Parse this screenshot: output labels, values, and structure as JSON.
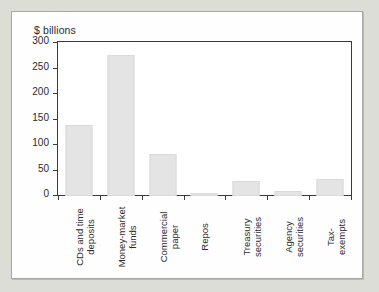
{
  "chart_data": {
    "type": "bar",
    "title": "",
    "subtitle": "",
    "ylabel": "$ billions",
    "xlabel": "",
    "ylim": [
      0,
      300
    ],
    "yticks": [
      0,
      50,
      100,
      150,
      200,
      250,
      300
    ],
    "ytick_labels": [
      "0",
      "50",
      "100",
      "150",
      "200",
      "250",
      "300"
    ],
    "grid": false,
    "legend": null,
    "bar_color": "#e4e4e4",
    "bar_edge_color": "#dadada",
    "axis_color": "#3a3a3a",
    "categories": [
      "CDs and time deposits",
      "Money-market funds",
      "Commercial paper",
      "Repos",
      "Treasury securities",
      "Agency securities",
      "Tax-exempts"
    ],
    "category_lines": [
      [
        "CDs and time",
        "deposits"
      ],
      [
        "Money-market",
        "funds"
      ],
      [
        "Commercial",
        "paper"
      ],
      [
        "Repos"
      ],
      [
        "Treasury",
        "securities"
      ],
      [
        "Agency",
        "securities"
      ],
      [
        "Tax-",
        "exempts"
      ]
    ],
    "values": [
      140,
      277,
      82,
      6,
      30,
      9,
      34
    ]
  },
  "page": {
    "background_color": "#ddddd8",
    "card_background": "#fefefe",
    "card_border_color": "#a9a9a4"
  }
}
